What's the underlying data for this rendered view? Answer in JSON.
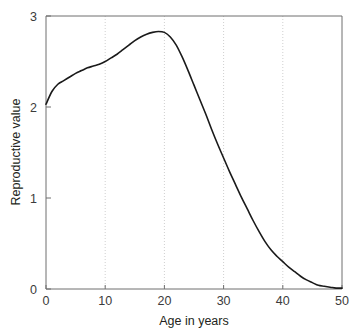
{
  "chart_data": {
    "type": "line",
    "title": "",
    "xlabel": "Age in years",
    "ylabel": "Reproductive value",
    "xlim": [
      0,
      50
    ],
    "ylim": [
      0,
      3
    ],
    "xticks": [
      "0",
      "10",
      "20",
      "30",
      "40",
      "50"
    ],
    "xtick_values": [
      0,
      10,
      20,
      30,
      40,
      50
    ],
    "yticks": [
      "0",
      "1",
      "2",
      "3"
    ],
    "ytick_values": [
      0,
      1,
      2,
      3
    ],
    "grid": "vertical-dotted",
    "grid_color": "#cfcfcf",
    "legend": "none",
    "line_color": "#1a1a1a",
    "line_width": 1.6,
    "axis_color": "#6e6e6e",
    "background": "#ffffff",
    "series": [
      {
        "name": "Reproductive value",
        "x": [
          0,
          1,
          2,
          3,
          4,
          5,
          6,
          7,
          8,
          9,
          10,
          11,
          12,
          13,
          14,
          15,
          16,
          17,
          18,
          19,
          20,
          21,
          22,
          23,
          24,
          25,
          26,
          27,
          28,
          29,
          30,
          31,
          32,
          33,
          34,
          35,
          36,
          37,
          38,
          39,
          40,
          41,
          42,
          43,
          44,
          45,
          46,
          47,
          48,
          49,
          50
        ],
        "y": [
          2.03,
          2.17,
          2.25,
          2.29,
          2.33,
          2.37,
          2.4,
          2.43,
          2.45,
          2.47,
          2.5,
          2.54,
          2.58,
          2.63,
          2.68,
          2.73,
          2.77,
          2.8,
          2.82,
          2.83,
          2.82,
          2.77,
          2.68,
          2.55,
          2.4,
          2.24,
          2.08,
          1.92,
          1.75,
          1.59,
          1.44,
          1.29,
          1.15,
          1.01,
          0.88,
          0.75,
          0.63,
          0.52,
          0.43,
          0.36,
          0.3,
          0.24,
          0.19,
          0.14,
          0.1,
          0.07,
          0.04,
          0.03,
          0.02,
          0.01,
          0.01
        ]
      }
    ]
  },
  "axes": {
    "x_label": "Age in years",
    "y_label": "Reproductive value"
  }
}
